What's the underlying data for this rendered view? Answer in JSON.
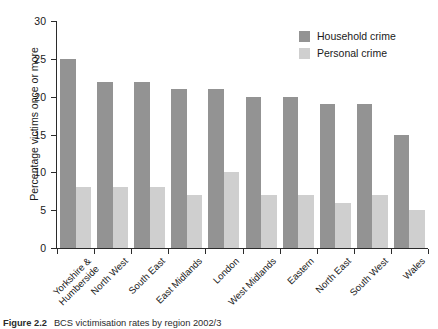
{
  "chart_data": {
    "type": "bar",
    "title": "",
    "xlabel": "",
    "ylabel": "Percentage victims once or more",
    "ylim": [
      0,
      30
    ],
    "yticks": [
      0,
      5,
      10,
      15,
      20,
      25,
      30
    ],
    "ytick_labels": [
      "0",
      "5",
      "10",
      "15",
      "20",
      "25",
      "30"
    ],
    "grid": false,
    "legend_position": "top-right",
    "categories": [
      "Yorkshire &\nHumberside",
      "North West",
      "South East",
      "East Midlands",
      "London",
      "West Midlands",
      "Eastern",
      "North East",
      "South West",
      "Wales"
    ],
    "series": [
      {
        "name": "Household crime",
        "color": "#939393",
        "values": [
          25,
          22,
          22,
          21,
          21,
          20,
          20,
          19,
          19,
          15
        ]
      },
      {
        "name": "Personal crime",
        "color": "#cfcfcf",
        "values": [
          8,
          8,
          8,
          7,
          10,
          7,
          7,
          6,
          7,
          5
        ]
      }
    ]
  },
  "caption": {
    "label": "Figure 2.2",
    "text": "BCS victimisation rates by region 2002/3"
  }
}
